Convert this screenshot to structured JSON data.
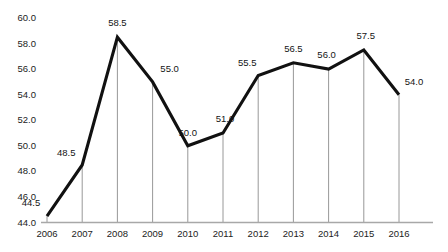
{
  "chart_data": {
    "type": "line",
    "title": "PERMANENT ESTATE",
    "xlabel": "",
    "ylabel": "",
    "categories": [
      "2006",
      "2007",
      "2008",
      "2009",
      "2010",
      "2011",
      "2012",
      "2013",
      "2014",
      "2015",
      "2016"
    ],
    "values": [
      44.5,
      48.5,
      58.5,
      55.0,
      50.0,
      51.0,
      55.5,
      56.5,
      56.0,
      57.5,
      54.0
    ],
    "point_labels": [
      "44.5",
      "48.5",
      "58.5",
      "55.0",
      "50.0",
      "51.0",
      "55.5",
      "56.5",
      "56.0",
      "57.5",
      "54.0"
    ],
    "ylim": [
      44.0,
      60.0
    ],
    "ytick_values": [
      60.0,
      58.0,
      56.0,
      54.0,
      52.0,
      50.0,
      48.0,
      46.0,
      44.0
    ],
    "ytick_labels": [
      "60.0",
      "58.0",
      "56.0",
      "54.0",
      "52.0",
      "50.0",
      "48.0",
      "46.0",
      "44.0"
    ],
    "grid": false,
    "drop_lines": true,
    "legend": false,
    "series": [
      {
        "name": "value",
        "values": [
          44.5,
          48.5,
          58.5,
          55.0,
          50.0,
          51.0,
          55.5,
          56.5,
          56.0,
          57.5,
          54.0
        ]
      }
    ],
    "colors": {
      "line": "#111111",
      "drop_line": "#8c8c8c",
      "axis": "#a8a8a8",
      "label_text": "#141414",
      "title_text": "#9a9aa2",
      "background": "#ffffff"
    },
    "label_offsets": [
      {
        "dx": -16,
        "dy": -13
      },
      {
        "dx": -16,
        "dy": -12
      },
      {
        "dx": 0,
        "dy": -14
      },
      {
        "dx": 17,
        "dy": -13
      },
      {
        "dx": 0,
        "dy": -13
      },
      {
        "dx": 2,
        "dy": -14
      },
      {
        "dx": -11,
        "dy": -13
      },
      {
        "dx": 0,
        "dy": -14
      },
      {
        "dx": -2,
        "dy": -14
      },
      {
        "dx": 2,
        "dy": -14
      },
      {
        "dx": 15,
        "dy": -13
      }
    ]
  }
}
